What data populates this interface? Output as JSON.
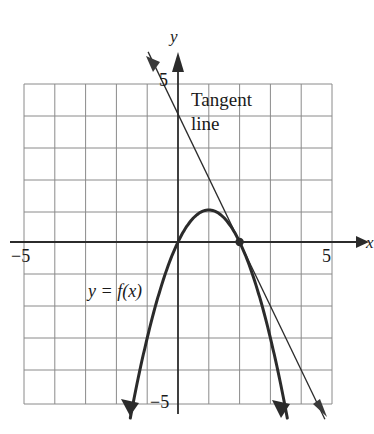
{
  "chart_data": {
    "type": "line",
    "title": "",
    "xlabel": "x",
    "ylabel": "y",
    "xlim": [
      -5,
      5
    ],
    "ylim": [
      -5,
      5
    ],
    "grid": true,
    "grid_step": 1,
    "legend": "none",
    "axis_tick_labels": {
      "x_left": "−5",
      "x_right": "5",
      "y_top": "5",
      "y_bottom": "−5"
    },
    "series": [
      {
        "name": "y = f(x)",
        "type": "parabola",
        "equation": "y = -(x - 1)^2 + 1",
        "vertex": [
          1,
          1
        ],
        "roots": [
          0,
          2
        ],
        "opens": "down",
        "color": "#2b2b2b",
        "linewidth": 3,
        "arrows": "both-ends-down",
        "x_range": [
          -1.55,
          3.55
        ],
        "label": "y = f(x)",
        "label_position": [
          -2.85,
          -1.5
        ]
      },
      {
        "name": "Tangent line",
        "type": "line",
        "equation": "y = -2(x - 2)",
        "slope": -2,
        "y_intercept": 4,
        "point_of_tangency": [
          2,
          0
        ],
        "color": "#2b2b2b",
        "linewidth": 1.3,
        "arrows": "both",
        "x_range": [
          -0.97,
          4.77
        ],
        "label": "Tangent line",
        "label_position": [
          0.5,
          4.35
        ]
      }
    ],
    "points": [
      {
        "name": "point-of-tangency",
        "x": 2,
        "y": 0,
        "marker": "filled-dot",
        "color": "#2b2b2b"
      }
    ],
    "annotations": [
      {
        "name": "tangent-line-label-line1",
        "text": "Tangent",
        "x": 0.5,
        "y": 4.6
      },
      {
        "name": "tangent-line-label-line2",
        "text": "line",
        "x": 0.5,
        "y": 3.85
      },
      {
        "name": "function-label",
        "text": "y = f(x)",
        "x": -2.85,
        "y": -1.5
      }
    ]
  },
  "figure": {
    "axis_y_name": "y",
    "axis_x_name": "x",
    "y_axis_tick": "5",
    "x_axis_tick_right": "5",
    "x_axis_tick_left": "−5",
    "y_axis_tick_bottom": "−5",
    "tangent_label_line1": "Tangent",
    "tangent_label_line2": "line",
    "function_label_y": "y",
    "function_label_eq": "= f",
    "function_label_arg": "(x)",
    "function_label_full": "y = f(x)"
  },
  "colors": {
    "grid": "#8a8a8a",
    "axis": "#2b2b2b",
    "curve": "#2b2b2b",
    "tangent": "#3a3a3a",
    "background": "#ffffff",
    "text": "#1a1a1a"
  }
}
